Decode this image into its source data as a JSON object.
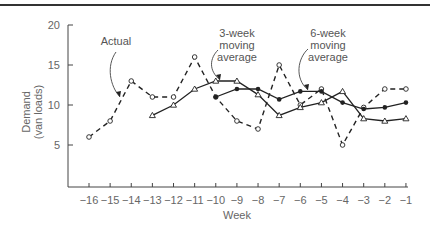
{
  "chart_data": {
    "type": "line",
    "title": "",
    "xlabel": "Week",
    "ylabel_lines": [
      "Demand",
      "(van loads)"
    ],
    "ylabel": "Demand (van loads)",
    "x": [
      -16,
      -15,
      -14,
      -13,
      -12,
      -11,
      -10,
      -9,
      -8,
      -7,
      -6,
      -5,
      -4,
      -3,
      -2,
      -1
    ],
    "x_tick_labels": [
      "−16",
      "−15",
      "−14",
      "−13",
      "−12",
      "−11",
      "−10",
      "−9",
      "−8",
      "−7",
      "−6",
      "−5",
      "−4",
      "−3",
      "−2",
      "−1"
    ],
    "y_ticks": [
      5,
      10,
      15,
      20
    ],
    "ylim": [
      0,
      20
    ],
    "grid": false,
    "legend": "none (inline annotations)",
    "series": [
      {
        "name": "Actual",
        "style": "dashed",
        "marker": "open-circle",
        "x": [
          -16,
          -15,
          -14,
          -13,
          -12,
          -11,
          -10,
          -9,
          -8,
          -7,
          -6,
          -5,
          -4,
          -3,
          -2,
          -1
        ],
        "values": [
          6,
          8,
          13,
          11,
          11,
          16,
          11,
          8,
          7,
          15,
          10,
          12,
          5,
          9.7,
          12,
          12
        ]
      },
      {
        "name": "3-week moving average",
        "style": "solid",
        "marker": "open-triangle",
        "x": [
          -13,
          -12,
          -11,
          -10,
          -9,
          -8,
          -7,
          -6,
          -5,
          -4,
          -3,
          -2,
          -1
        ],
        "values": [
          8.7,
          10,
          12,
          13,
          13,
          11.3,
          8.7,
          9.7,
          10.3,
          11.7,
          8.3,
          8,
          8.3
        ]
      },
      {
        "name": "6-week moving average",
        "style": "solid",
        "marker": "filled-circle",
        "x": [
          -10,
          -9,
          -8,
          -7,
          -6,
          -5,
          -4,
          -3,
          -2,
          -1
        ],
        "values": [
          11,
          12,
          12,
          10.7,
          11.7,
          11.7,
          10.3,
          9.5,
          9.7,
          10.3
        ]
      }
    ],
    "annotations": [
      {
        "text_lines": [
          "Actual"
        ],
        "points_to": "Actual at week -14.5"
      },
      {
        "text_lines": [
          "3-week",
          "moving",
          "average"
        ],
        "points_to": "3-week moving average near week -10"
      },
      {
        "text_lines": [
          "6-week",
          "moving",
          "average"
        ],
        "points_to": "6-week moving average near week -6"
      }
    ]
  },
  "colors": {
    "line": "#222222",
    "axis": "#444444",
    "text": "#666666",
    "border": "#333333"
  }
}
